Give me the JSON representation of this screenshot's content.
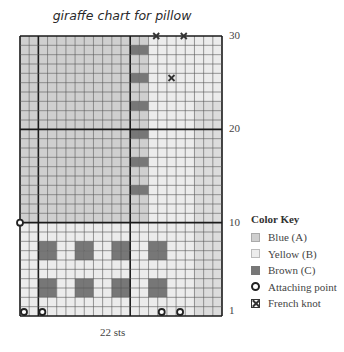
{
  "title": "giraffe chart for pillow",
  "stitch_count_label": "22 sts",
  "row_labels": [
    {
      "label": "30",
      "row": 30
    },
    {
      "label": "20",
      "row": 20
    },
    {
      "label": "10",
      "row": 10
    },
    {
      "label": "1",
      "row": 1
    }
  ],
  "grid": {
    "columns": 22,
    "rows": 30,
    "thick_vertical_lines_after_col": [
      2,
      12
    ],
    "thick_horizontal_lines_at_row": [
      10,
      20
    ],
    "colors": {
      "A": "#cfcfcf",
      "B": "#ececec",
      "C": "#777777",
      "A2": "#dcdcdc"
    },
    "legend_codes": "A=Blue, B=Yellow, C=Brown, a=light blue edge",
    "cells_top_to_bottom": [
      "AAAAAAAAAAAAAABBBBBBBB",
      "AAAAAAAAAAAACCBBBBBBBB",
      "AAAAAAAAAAAAAABBBBBBBB",
      "AAAAAAAAAAAAAABBBBBBBB",
      "AAAAAAAAAAAACCBBBBBBBB",
      "AAAAAAAAAAAAAABBBBBBBB",
      "AAAAAAAAAAAAAABBBBBBBB",
      "AAAAAAAAAAAACCBBBBBaaa",
      "AAAAAAAAAAAAAABBBBBaaa",
      "AAAAAAAAAAAAAABBBBBaaa",
      "AAAAAAAAAAAACCBBBBBaaa",
      "AAAAAAAAAAAAAABBBBBaaa",
      "AAAAAAAAAAAAAABBBBBaaa",
      "AAAAAAAAAAAACCBBBBBaaa",
      "AAAAAAAAAAAAAABBBBBaaa",
      "AAAAAAAAAAAAAABBBBBaaa",
      "AAAAAAAAAAAACCBBBBBaaa",
      "AAAAAAAAAAAAAABBBBBaaa",
      "AAAAAAAAAAAAAABBBBBaaa",
      "AAAAAAAAAAAAAABBBBBaaa",
      "BBBBBBBBBBBBBBBBBBBaaa",
      "BBBBBBBBBBBBBBBBBBBaaa",
      "BBCCBBCCBBCCBBCCBBBaaa",
      "BBCCBBCCBBCCBBCCBBBaaa",
      "BBBBBBBBBBBBBBBBBBBaaa",
      "BBBBBBBBBBBBBBBBBBBaaa",
      "BBCCBBCCBBCCBBCCBBBaaa",
      "BBCCBBCCBBCCBBCCBBBaaa",
      "BBBBBBBBBBBBBBBBBBBaaa",
      "BBBBBBBBBBBBBBBBBBBaaa"
    ],
    "attaching_points": [
      {
        "col": 0,
        "row_from_top": 30,
        "edge": "bottom-left"
      },
      {
        "col": 2,
        "row_from_top": 30,
        "edge": "bottom-left"
      },
      {
        "col": 15,
        "row_from_top": 30,
        "edge": "bottom-left"
      },
      {
        "col": 17,
        "row_from_top": 30,
        "edge": "bottom-left"
      },
      {
        "col": 0,
        "row_from_top": 20,
        "edge": "line-left"
      }
    ],
    "french_knots": [
      {
        "col": 15,
        "row_from_top": 0,
        "edge": "top-line"
      },
      {
        "col": 18,
        "row_from_top": 0,
        "edge": "top-line"
      },
      {
        "col": 16.5,
        "row_from_top": 4.5,
        "edge": "center"
      }
    ]
  },
  "color_key": {
    "title": "Color Key",
    "items": [
      {
        "swatch": "blue-swatch",
        "label": "Blue (A)"
      },
      {
        "swatch": "yellow-swatch",
        "label": "Yellow (B)"
      },
      {
        "swatch": "brown-swatch",
        "label": "Brown (C)"
      },
      {
        "swatch": "attaching-point-icon",
        "label": "Attaching point"
      },
      {
        "swatch": "french-knot-icon",
        "label": "French knot"
      }
    ]
  }
}
